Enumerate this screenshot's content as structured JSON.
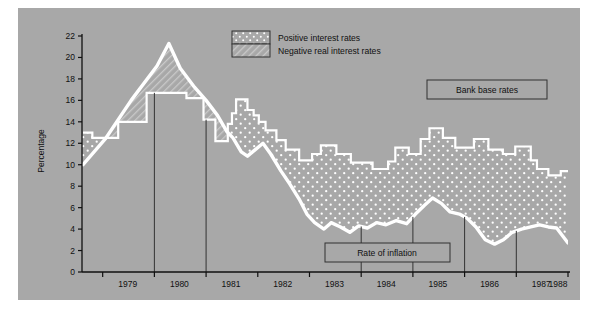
{
  "figure": {
    "background": "#a8a8a8",
    "page_background": "#ffffff",
    "ylabel": "Percentage",
    "series_label_bank": "Bank base rates",
    "series_label_inflation": "Rate of inflation",
    "legend": [
      {
        "key": "positive",
        "label": "Positive interest rates",
        "pattern": "dots",
        "color": "#a8a8a8"
      },
      {
        "key": "negative",
        "label": "Negative real interest rates",
        "pattern": "hatch",
        "color": "#a8a8a8"
      }
    ],
    "line_color": "#ffffff",
    "rule_color": "#333333"
  },
  "chart_data": {
    "type": "area",
    "title": "",
    "subtitle": "",
    "xlabel": "",
    "ylabel": "Percentage",
    "xlim": [
      1978.6,
      1988.0
    ],
    "ylim": [
      0,
      22
    ],
    "yticks": [
      0,
      2,
      4,
      6,
      8,
      10,
      12,
      14,
      16,
      18,
      20,
      22
    ],
    "xticks": [
      1979,
      1980,
      1981,
      1982,
      1983,
      1984,
      1985,
      1986,
      1987,
      1988
    ],
    "xticklabels": [
      "1979",
      "1980",
      "1981",
      "1982",
      "1983",
      "1984",
      "1985",
      "1986",
      "1987",
      "1988"
    ],
    "grid": false,
    "legend_position": "top-center",
    "annotations": [
      {
        "text": "Bank base rates",
        "x": 1987.0,
        "y": 16.3,
        "boxed": true
      },
      {
        "text": "Rate of inflation",
        "x": 1984.6,
        "y": 2.9,
        "boxed": true
      }
    ],
    "series": [
      {
        "name": "Bank base rates",
        "style": "step",
        "values": [
          {
            "x": 1978.62,
            "y": 13.0
          },
          {
            "x": 1978.8,
            "y": 12.5
          },
          {
            "x": 1979.05,
            "y": 12.5
          },
          {
            "x": 1979.3,
            "y": 14.0
          },
          {
            "x": 1979.62,
            "y": 14.0
          },
          {
            "x": 1979.85,
            "y": 16.7
          },
          {
            "x": 1980.55,
            "y": 16.7
          },
          {
            "x": 1980.62,
            "y": 16.2
          },
          {
            "x": 1980.9,
            "y": 16.2
          },
          {
            "x": 1980.95,
            "y": 14.2
          },
          {
            "x": 1981.1,
            "y": 14.2
          },
          {
            "x": 1981.18,
            "y": 12.2
          },
          {
            "x": 1981.35,
            "y": 12.2
          },
          {
            "x": 1981.42,
            "y": 13.8
          },
          {
            "x": 1981.5,
            "y": 14.8
          },
          {
            "x": 1981.58,
            "y": 16.1
          },
          {
            "x": 1981.72,
            "y": 16.1
          },
          {
            "x": 1981.8,
            "y": 15.1
          },
          {
            "x": 1981.92,
            "y": 14.6
          },
          {
            "x": 1982.02,
            "y": 14.0
          },
          {
            "x": 1982.15,
            "y": 13.2
          },
          {
            "x": 1982.28,
            "y": 13.2
          },
          {
            "x": 1982.36,
            "y": 12.3
          },
          {
            "x": 1982.46,
            "y": 12.3
          },
          {
            "x": 1982.54,
            "y": 11.4
          },
          {
            "x": 1982.7,
            "y": 11.4
          },
          {
            "x": 1982.8,
            "y": 10.4
          },
          {
            "x": 1982.95,
            "y": 10.4
          },
          {
            "x": 1983.05,
            "y": 11.0
          },
          {
            "x": 1983.22,
            "y": 11.8
          },
          {
            "x": 1983.42,
            "y": 11.8
          },
          {
            "x": 1983.52,
            "y": 11.0
          },
          {
            "x": 1983.7,
            "y": 11.0
          },
          {
            "x": 1983.8,
            "y": 10.2
          },
          {
            "x": 1984.12,
            "y": 10.2
          },
          {
            "x": 1984.22,
            "y": 9.6
          },
          {
            "x": 1984.42,
            "y": 9.6
          },
          {
            "x": 1984.52,
            "y": 10.3
          },
          {
            "x": 1984.66,
            "y": 11.6
          },
          {
            "x": 1984.82,
            "y": 11.6
          },
          {
            "x": 1984.92,
            "y": 11.0
          },
          {
            "x": 1985.05,
            "y": 11.0
          },
          {
            "x": 1985.15,
            "y": 12.4
          },
          {
            "x": 1985.32,
            "y": 13.4
          },
          {
            "x": 1985.48,
            "y": 13.4
          },
          {
            "x": 1985.58,
            "y": 12.5
          },
          {
            "x": 1985.72,
            "y": 12.5
          },
          {
            "x": 1985.82,
            "y": 11.6
          },
          {
            "x": 1986.05,
            "y": 11.6
          },
          {
            "x": 1986.18,
            "y": 12.4
          },
          {
            "x": 1986.34,
            "y": 12.4
          },
          {
            "x": 1986.46,
            "y": 11.4
          },
          {
            "x": 1986.62,
            "y": 11.4
          },
          {
            "x": 1986.74,
            "y": 11.0
          },
          {
            "x": 1986.88,
            "y": 11.0
          },
          {
            "x": 1986.98,
            "y": 11.7
          },
          {
            "x": 1987.18,
            "y": 11.7
          },
          {
            "x": 1987.28,
            "y": 10.4
          },
          {
            "x": 1987.4,
            "y": 9.6
          },
          {
            "x": 1987.52,
            "y": 9.6
          },
          {
            "x": 1987.62,
            "y": 9.0
          },
          {
            "x": 1987.76,
            "y": 9.0
          },
          {
            "x": 1987.86,
            "y": 9.4
          },
          {
            "x": 1988.0,
            "y": 9.4
          }
        ]
      },
      {
        "name": "Rate of inflation",
        "style": "line",
        "values": [
          {
            "x": 1978.62,
            "y": 10.0
          },
          {
            "x": 1979.05,
            "y": 12.4
          },
          {
            "x": 1979.55,
            "y": 16.0
          },
          {
            "x": 1980.05,
            "y": 19.2
          },
          {
            "x": 1980.28,
            "y": 21.3
          },
          {
            "x": 1980.5,
            "y": 19.0
          },
          {
            "x": 1980.78,
            "y": 17.2
          },
          {
            "x": 1981.0,
            "y": 16.0
          },
          {
            "x": 1981.22,
            "y": 14.6
          },
          {
            "x": 1981.4,
            "y": 13.1
          },
          {
            "x": 1981.52,
            "y": 12.5
          },
          {
            "x": 1981.68,
            "y": 11.2
          },
          {
            "x": 1981.8,
            "y": 10.8
          },
          {
            "x": 1681.95,
            "y": 11.4
          },
          {
            "x": 1982.1,
            "y": 12.0
          },
          {
            "x": 1982.25,
            "y": 11.0
          },
          {
            "x": 1982.45,
            "y": 9.4
          },
          {
            "x": 1982.62,
            "y": 8.2
          },
          {
            "x": 1982.8,
            "y": 6.8
          },
          {
            "x": 1982.95,
            "y": 5.4
          },
          {
            "x": 1983.1,
            "y": 4.6
          },
          {
            "x": 1983.28,
            "y": 4.0
          },
          {
            "x": 1983.42,
            "y": 4.6
          },
          {
            "x": 1983.6,
            "y": 4.2
          },
          {
            "x": 1983.78,
            "y": 3.7
          },
          {
            "x": 1983.95,
            "y": 4.3
          },
          {
            "x": 1984.12,
            "y": 4.1
          },
          {
            "x": 1984.3,
            "y": 4.6
          },
          {
            "x": 1984.48,
            "y": 4.4
          },
          {
            "x": 1984.68,
            "y": 4.8
          },
          {
            "x": 1984.88,
            "y": 4.5
          },
          {
            "x": 1985.05,
            "y": 5.4
          },
          {
            "x": 1985.22,
            "y": 6.2
          },
          {
            "x": 1985.38,
            "y": 6.9
          },
          {
            "x": 1985.55,
            "y": 6.4
          },
          {
            "x": 1985.72,
            "y": 5.6
          },
          {
            "x": 1985.9,
            "y": 5.4
          },
          {
            "x": 1986.05,
            "y": 5.0
          },
          {
            "x": 1986.22,
            "y": 4.2
          },
          {
            "x": 1986.4,
            "y": 3.0
          },
          {
            "x": 1986.58,
            "y": 2.6
          },
          {
            "x": 1986.75,
            "y": 3.0
          },
          {
            "x": 1986.92,
            "y": 3.7
          },
          {
            "x": 1987.1,
            "y": 4.0
          },
          {
            "x": 1987.28,
            "y": 4.2
          },
          {
            "x": 1987.45,
            "y": 4.4
          },
          {
            "x": 1987.62,
            "y": 4.2
          },
          {
            "x": 1987.78,
            "y": 4.1
          },
          {
            "x": 1988.0,
            "y": 2.7
          }
        ]
      }
    ]
  }
}
